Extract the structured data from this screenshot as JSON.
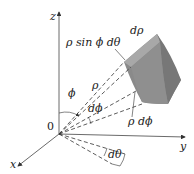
{
  "figure": {
    "type": "spherical-volume-element",
    "axes": {
      "z": "z",
      "y": "y",
      "x": "x",
      "origin": "0"
    },
    "labels": {
      "rho_sin_phi_dtheta": "ρ sin ϕ dθ",
      "d_rho": "dρ",
      "phi": "ϕ",
      "rho": "ρ",
      "d_phi": "dϕ",
      "rho_d_phi": "ρ dϕ",
      "d_theta": "dθ"
    },
    "colors": {
      "wedge_front": "#8a8a8a",
      "wedge_top": "#a8a8a8",
      "wedge_side": "#7a7a7a",
      "lines": "#333333",
      "background": "#ffffff"
    }
  }
}
